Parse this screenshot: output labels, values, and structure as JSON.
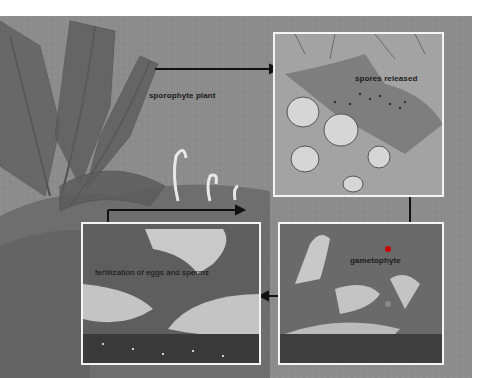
{
  "diagram": {
    "stages": [
      {
        "id": "sporophyte",
        "label": "sporophyte plant"
      },
      {
        "id": "spores",
        "label": "spores released"
      },
      {
        "id": "gametophyte",
        "label": "gametophyte"
      },
      {
        "id": "fertilization",
        "label": "fertilization of eggs and sperms"
      }
    ],
    "flow": [
      "sporophyte plant",
      "spores released",
      "gametophyte",
      "fertilization of eggs and sperms",
      "sporophyte plant"
    ],
    "colors": {
      "background": "#8e8e8e",
      "panel_border": "#f4f4f4",
      "arrow": "#111111",
      "label": "#1a1a1a"
    }
  }
}
